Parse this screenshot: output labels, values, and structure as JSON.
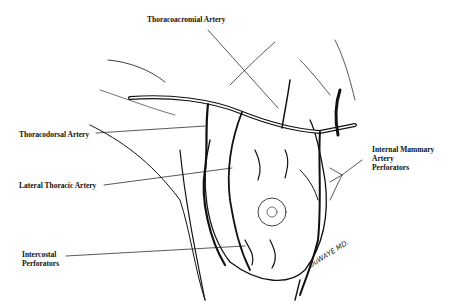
{
  "figure": {
    "labels": {
      "thoracoacromial": "Thoracoacromial Artery",
      "thoracodorsal": "Thoracodorsal Artery",
      "lateral_thoracic": "Lateral Thoracic Artery",
      "intercostal_line1": "Intercostal",
      "intercostal_line2": "Perforators",
      "internal_mammary_line1": "Internal Mammary",
      "internal_mammary_line2": "Artery",
      "internal_mammary_line3": "Perforators"
    },
    "signature": "DuWAYE MD.",
    "colors": {
      "ink": "#111111",
      "background": "#ffffff"
    }
  }
}
